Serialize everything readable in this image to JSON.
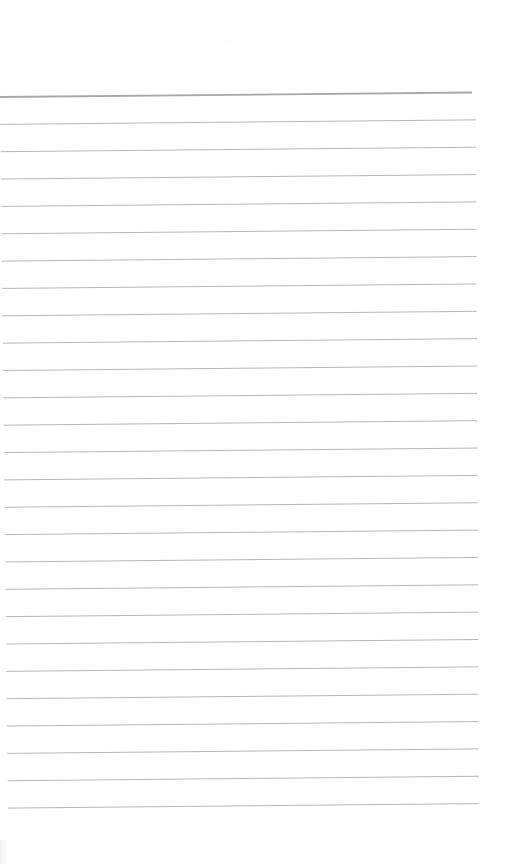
{
  "document": {
    "type": "lined-paper",
    "paper_color": "#ffffff",
    "line_color": "#b8b8b8",
    "top_line_color": "#a8a8a8",
    "line_count": 27,
    "line_spacing_px": 27.35,
    "first_line": {
      "x1": 0,
      "y1": 97,
      "x2": 472,
      "y2": 92,
      "stroke_width": 1.8
    },
    "line_start_x": 0,
    "line_end_x": 476,
    "tilt_px": 4.5,
    "text_content": ""
  }
}
